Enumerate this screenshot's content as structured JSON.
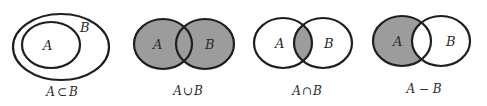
{
  "colors": {
    "stroke": "#1e1e1e",
    "shade": "#9c9c9c",
    "background": "#ffffff",
    "text": "#2a2a2a"
  },
  "diagrams": [
    {
      "id": "subset",
      "labels": {
        "a": "A",
        "b": "B"
      },
      "caption": {
        "left": "A",
        "op": "⊂",
        "right": "B"
      },
      "shaded": "none"
    },
    {
      "id": "union",
      "labels": {
        "a": "A",
        "b": "B"
      },
      "caption": {
        "left": "A",
        "op": "∪",
        "right": "B"
      },
      "shaded": "A ∪ B"
    },
    {
      "id": "intersection",
      "labels": {
        "a": "A",
        "b": "B"
      },
      "caption": {
        "left": "A",
        "op": "∩",
        "right": "B"
      },
      "shaded": "A ∩ B"
    },
    {
      "id": "difference",
      "labels": {
        "a": "A",
        "b": "B"
      },
      "caption": {
        "left": "A",
        "op": " − ",
        "right": "B"
      },
      "shaded": "A − B"
    }
  ]
}
